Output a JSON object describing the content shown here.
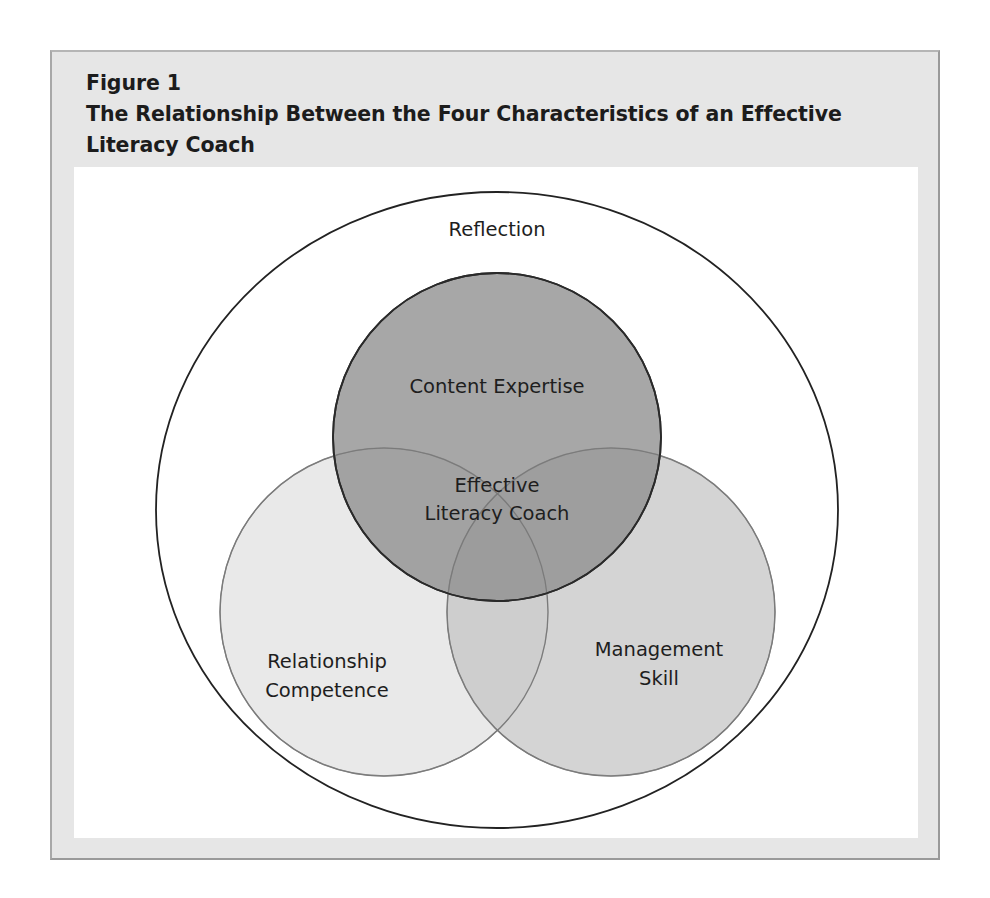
{
  "figure": {
    "label": "Figure 1",
    "title_line1": "The Relationship Between the Four Characteristics of an Effective",
    "title_line2": "Literacy Coach"
  },
  "diagram": {
    "type": "venn",
    "outer_set": {
      "label": "Reflection",
      "fill": "#ffffff",
      "stroke": "#222222"
    },
    "sets": [
      {
        "id": "content-expertise",
        "label_lines": [
          "Content Expertise"
        ],
        "fill": "#a3a3a3",
        "stroke": "#2a2a2a"
      },
      {
        "id": "relationship-competence",
        "label_lines": [
          "Relationship",
          "Competence"
        ],
        "fill": "#e9e9e9",
        "stroke": "#8c8c8c"
      },
      {
        "id": "management-skill",
        "label_lines": [
          "Management",
          "Skill"
        ],
        "fill": "#d2d2d2",
        "stroke": "#8c8c8c"
      }
    ],
    "center_label_lines": [
      "Effective",
      "Literacy Coach"
    ]
  },
  "colors": {
    "frame_bg": "#e6e6e6",
    "frame_border": "#9a9a9a",
    "inner_bg": "#ffffff",
    "text": "#1c1c1c"
  }
}
